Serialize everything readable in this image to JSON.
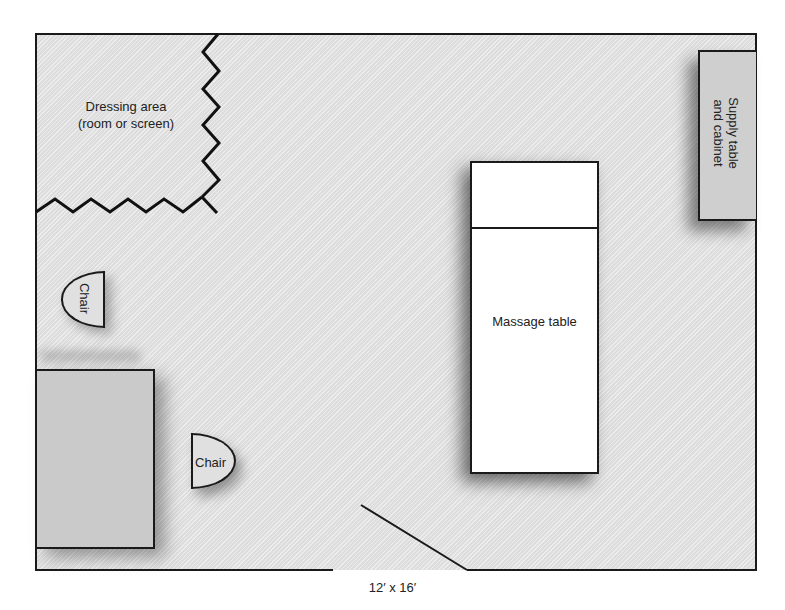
{
  "diagram": {
    "type": "floor-plan",
    "room_size_caption": "12′ x 16′",
    "areas": {
      "dressing_area": {
        "line1": "Dressing area",
        "line2": "(room or screen)"
      }
    },
    "furniture": {
      "supply_table": {
        "line1": "Supply table",
        "line2": "and cabinet"
      },
      "massage_table": {
        "label": "Massage table"
      },
      "chair_left": {
        "label": "Chair"
      },
      "chair_desk": {
        "label": "Chair"
      },
      "desk": {
        "label": ""
      }
    },
    "features": [
      "door (bottom wall opening)",
      "dressing area partition (zigzag)"
    ],
    "colors": {
      "floor": "#e4e4e4",
      "walls": "#1a1a1a",
      "furniture_gray": "#cacaca",
      "table_white": "#ffffff"
    }
  }
}
